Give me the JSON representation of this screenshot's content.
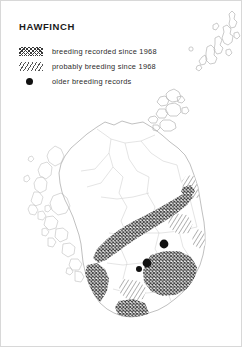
{
  "title": "HAWFINCH",
  "legend": {
    "items": [
      {
        "key": "cross-hatch-swatch",
        "icon": "cross-hatch-swatch-icon",
        "label": "breeding recorded since 1968"
      },
      {
        "key": "diagonal-hatch-swatch",
        "icon": "diagonal-hatch-swatch-icon",
        "label": "probably breeding since 1968"
      },
      {
        "key": "black-dot-swatch",
        "icon": "filled-circle-icon",
        "label": "older breeding records"
      }
    ]
  },
  "map": {
    "region_name": "Scotland",
    "insets": [
      "Shetland Islands",
      "Orkney Islands"
    ],
    "colors": {
      "coastline": "#b9b9b9",
      "county_boundary": "#cfcfcf",
      "hatch_dark": "#3a3a3a",
      "hatch_light": "#6a6a6a",
      "dot": "#111111",
      "background": "#ffffff"
    },
    "older_breeding_record_dots": [
      {
        "x": 163,
        "y": 243
      },
      {
        "x": 146,
        "y": 262
      },
      {
        "x": 138,
        "y": 268
      }
    ]
  }
}
